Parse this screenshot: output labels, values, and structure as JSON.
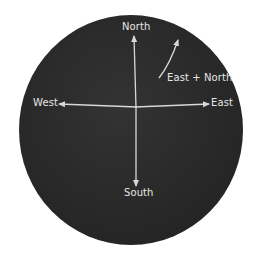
{
  "diagram": {
    "type": "compass-directions",
    "background_color": "#2b2b2b",
    "line_color": "#d8d8d8",
    "labels": {
      "north": "North",
      "south": "South",
      "east": "East",
      "west": "West",
      "east_north": "East + North"
    }
  }
}
